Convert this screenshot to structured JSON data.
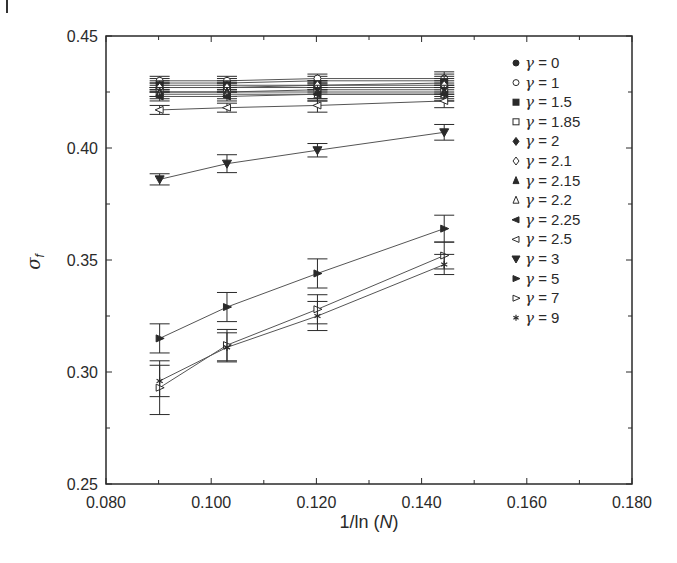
{
  "figure": {
    "panel_mark": "I"
  },
  "chart_data": {
    "type": "line",
    "title": "",
    "xlabel": "1/ln (N)",
    "ylabel": "σf",
    "xlim": [
      0.08,
      0.18
    ],
    "ylim": [
      0.25,
      0.45
    ],
    "x_ticks": [
      "0.080",
      "0.100",
      "0.120",
      "0.140",
      "0.160",
      "0.180"
    ],
    "x_tick_values": [
      0.08,
      0.1,
      0.12,
      0.14,
      0.16,
      0.18
    ],
    "y_ticks": [
      "0.25",
      "0.30",
      "0.35",
      "0.40",
      "0.45"
    ],
    "y_tick_values": [
      0.25,
      0.3,
      0.35,
      0.4,
      0.45
    ],
    "grid": false,
    "legend_position": "upper right inside",
    "error_bars": true,
    "x": [
      0.0902,
      0.103,
      0.1202,
      0.1443
    ],
    "series": [
      {
        "name": "γ = 0",
        "marker": "filled-circle",
        "values": [
          0.429,
          0.429,
          0.43,
          0.43
        ],
        "err": [
          0.002,
          0.002,
          0.002,
          0.003
        ]
      },
      {
        "name": "γ = 1",
        "marker": "open-circle",
        "values": [
          0.43,
          0.43,
          0.431,
          0.431
        ],
        "err": [
          0.002,
          0.002,
          0.002,
          0.003
        ]
      },
      {
        "name": "γ = 1.5",
        "marker": "filled-square",
        "values": [
          0.428,
          0.428,
          0.428,
          0.429
        ],
        "err": [
          0.002,
          0.002,
          0.002,
          0.003
        ]
      },
      {
        "name": "γ = 1.85",
        "marker": "open-square",
        "values": [
          0.425,
          0.425,
          0.426,
          0.426
        ],
        "err": [
          0.002,
          0.002,
          0.002,
          0.003
        ]
      },
      {
        "name": "γ = 2",
        "marker": "filled-diamond",
        "values": [
          0.427,
          0.427,
          0.427,
          0.427
        ],
        "err": [
          0.002,
          0.002,
          0.002,
          0.003
        ]
      },
      {
        "name": "γ = 2.1",
        "marker": "open-diamond",
        "values": [
          0.427,
          0.427,
          0.428,
          0.428
        ],
        "err": [
          0.002,
          0.002,
          0.002,
          0.003
        ]
      },
      {
        "name": "γ = 2.15",
        "marker": "filled-triangle-up",
        "values": [
          0.425,
          0.425,
          0.425,
          0.425
        ],
        "err": [
          0.002,
          0.002,
          0.003,
          0.003
        ]
      },
      {
        "name": "γ = 2.2",
        "marker": "open-triangle-up",
        "values": [
          0.424,
          0.424,
          0.424,
          0.424
        ],
        "err": [
          0.002,
          0.002,
          0.003,
          0.003
        ]
      },
      {
        "name": "γ = 2.25",
        "marker": "filled-triangle-left",
        "values": [
          0.423,
          0.423,
          0.424,
          0.424
        ],
        "err": [
          0.002,
          0.002,
          0.003,
          0.003
        ]
      },
      {
        "name": "γ = 2.5",
        "marker": "open-triangle-left",
        "values": [
          0.417,
          0.418,
          0.419,
          0.421
        ],
        "err": [
          0.002,
          0.002,
          0.003,
          0.003
        ]
      },
      {
        "name": "γ = 3",
        "marker": "filled-triangle-down",
        "values": [
          0.386,
          0.393,
          0.399,
          0.407
        ],
        "err": [
          0.0025,
          0.004,
          0.003,
          0.0035
        ]
      },
      {
        "name": "γ = 5",
        "marker": "filled-triangle-right",
        "values": [
          0.315,
          0.329,
          0.344,
          0.364
        ],
        "err": [
          0.0065,
          0.0065,
          0.0065,
          0.006
        ]
      },
      {
        "name": "γ = 7",
        "marker": "open-triangle-right",
        "values": [
          0.293,
          0.312,
          0.328,
          0.352
        ],
        "err": [
          0.012,
          0.007,
          0.0065,
          0.006
        ]
      },
      {
        "name": "γ = 9",
        "marker": "asterisk",
        "values": [
          0.296,
          0.311,
          0.325,
          0.348
        ],
        "err": [
          0.007,
          0.0065,
          0.0065,
          0.0045
        ]
      }
    ]
  },
  "colors": {
    "ink": "#2a2a2a",
    "line": "#555555",
    "background": "#ffffff"
  }
}
